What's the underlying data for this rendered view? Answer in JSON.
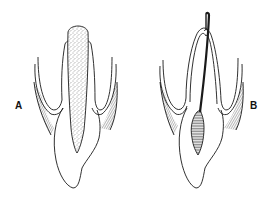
{
  "figure": {
    "panels": [
      {
        "id": "A",
        "label": "A",
        "description": "cross-section with stippled core filling"
      },
      {
        "id": "B",
        "label": "B",
        "description": "cross-section with thin filament and hatched inner region"
      }
    ]
  },
  "colors": {
    "ink": "#1a1a1a",
    "background": "#ffffff"
  }
}
